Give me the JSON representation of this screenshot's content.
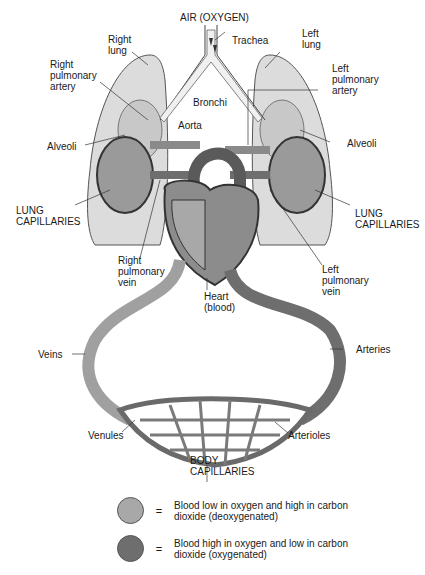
{
  "diagram": {
    "colors": {
      "deoxygenated": "#a8a8a8",
      "oxygenated": "#6e6e6e",
      "lung_fill": "#dcdcdc",
      "line": "#333333",
      "background": "#ffffff"
    },
    "labels": {
      "air": "AIR (OXYGEN)",
      "trachea": "Trachea",
      "right_lung": "Right\nlung",
      "left_lung": "Left\nlung",
      "right_pulmonary_artery": "Right\npulmonary\nartery",
      "left_pulmonary_artery": "Left\npulmonary\nartery",
      "bronchi": "Bronchi",
      "aorta": "Aorta",
      "alveoli_left_side": "Alveoli",
      "alveoli_right_side": "Alveoli",
      "lung_capillaries_left_side": "LUNG\nCAPILLARIES",
      "lung_capillaries_right_side": "LUNG\nCAPILLARIES",
      "right_pulmonary_vein": "Right\npulmonary\nvein",
      "left_pulmonary_vein": "Left\npulmonary\nvein",
      "heart": "Heart\n(blood)",
      "veins": "Veins",
      "arteries": "Arteries",
      "venules": "Venules",
      "arterioles": "Arterioles",
      "body_capillaries": "BODY\nCAPILLARIES"
    },
    "legend": [
      {
        "swatch": "deoxygenated",
        "symbol": "=",
        "text": "Blood low in oxygen and high in carbon dioxide (deoxygenated)"
      },
      {
        "swatch": "oxygenated",
        "symbol": "=",
        "text": "Blood high in oxygen and low in carbon dioxide (oxygenated)"
      }
    ]
  }
}
